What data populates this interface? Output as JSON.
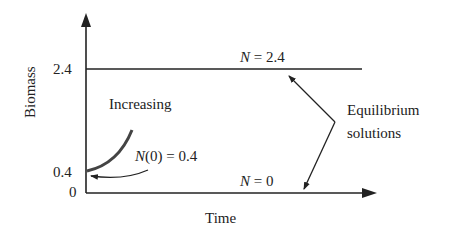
{
  "diagram": {
    "title": "",
    "axes": {
      "y_label": "Biomass",
      "x_label": "Time",
      "y_ticks": [
        "2.4",
        "0.4",
        "0"
      ]
    },
    "lines": {
      "upper": {
        "var": "N",
        "eq": " = 2.4"
      },
      "lower": {
        "var": "N",
        "eq": " = 0"
      }
    },
    "curve_label": "Increasing",
    "initial_condition": {
      "var": "N",
      "rest": "(0) = 0.4"
    },
    "annotation": {
      "line1": "Equilibrium",
      "line2": "solutions"
    },
    "colors": {
      "ink": "#222222",
      "curve": "#444444"
    }
  }
}
